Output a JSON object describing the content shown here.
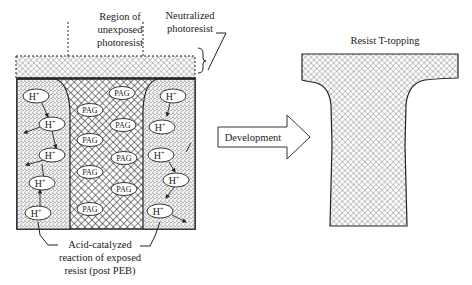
{
  "labels": {
    "region_unexposed": [
      "Region of",
      "unexposed",
      "photoresist"
    ],
    "neutralized": [
      "Neutralized",
      "photoresist"
    ],
    "acid_catalyzed": [
      "Acid-catalyzed",
      "reaction of exposed",
      "resist (post PEB)"
    ],
    "development": "Development",
    "t_topping": "Resist T-topping"
  },
  "molecules": {
    "pag": "PAG",
    "h": "H",
    "h_sup": "+"
  },
  "colors": {
    "stroke": "#222222",
    "hatch": "#333333",
    "background": "#ffffff"
  }
}
